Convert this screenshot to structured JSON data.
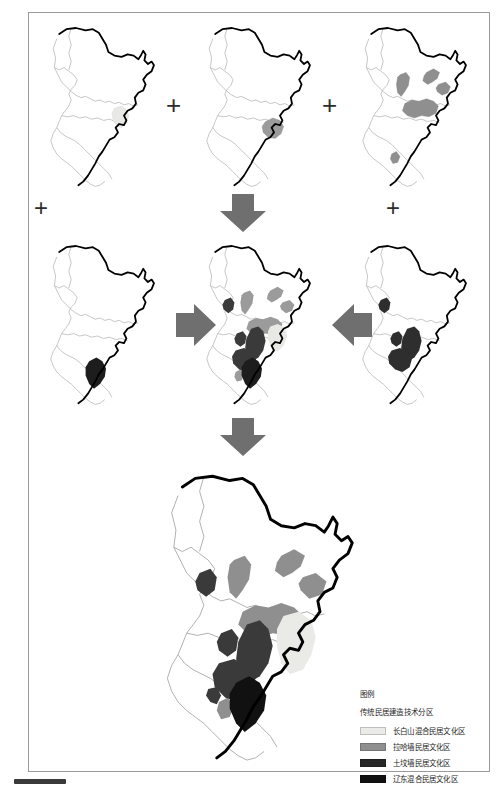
{
  "figure": {
    "type": "map-composite-diagram",
    "subject": "传统民居建造技术分区",
    "region": "Northeast China (Heilongjiang / Jilin / Liaoning)",
    "panel_count": 7,
    "connector_plus": "+",
    "panels": [
      {
        "id": "p1",
        "row": 1,
        "col": 1,
        "name": "changbai-mixed-layer",
        "highlight_color": "#e8e8e4",
        "layer_label": "长白山混合民居文化区"
      },
      {
        "id": "p2",
        "row": 1,
        "col": 2,
        "name": "laha-wall-layer",
        "highlight_color": "#9b9b9b",
        "layer_label": "拉哈墙民居文化区"
      },
      {
        "id": "p3",
        "row": 1,
        "col": 3,
        "name": "scattered-gray-layer",
        "highlight_color": "#8f8f8f",
        "layer_label": "拉哈墙民居文化区"
      },
      {
        "id": "p4",
        "row": 2,
        "col": 1,
        "name": "liaodong-mixed-layer",
        "highlight_color": "#1d1d1d",
        "layer_label": "辽东混合民居文化区"
      },
      {
        "id": "p5",
        "row": 2,
        "col": 2,
        "name": "combined-overlay-map",
        "highlight_color": "#555555",
        "layer_label": "叠加结果"
      },
      {
        "id": "p6",
        "row": 2,
        "col": 3,
        "name": "earth-wall-layer",
        "highlight_color": "#2e2e2e",
        "layer_label": "土坟墙民居文化区"
      },
      {
        "id": "p7",
        "row": 3,
        "col": 2,
        "name": "final-synthesis-map",
        "highlight_color": "#3a3a3a",
        "layer_label": "最终分区图"
      }
    ],
    "arrows": [
      {
        "name": "arrow-down-top",
        "direction": "down"
      },
      {
        "name": "arrow-right-mid",
        "direction": "right"
      },
      {
        "name": "arrow-left-mid",
        "direction": "left"
      },
      {
        "name": "arrow-down-bottom",
        "direction": "down"
      }
    ],
    "colors": {
      "boundary_national": "#000000",
      "boundary_province": "#a9a9a9",
      "arrow_fill": "#6f6f6f",
      "page_border": "#9a9a9a"
    }
  },
  "legend": {
    "title": "图例",
    "subtitle": "传统民居建造技术分区",
    "items": [
      {
        "label": "长白山混合民居文化区",
        "color": "#eaeae6"
      },
      {
        "label": "拉哈墙民居文化区",
        "color": "#8f8f8f"
      },
      {
        "label": "土坟墙民居文化区",
        "color": "#262626"
      },
      {
        "label": "辽东混合民居文化区",
        "color": "#111111"
      }
    ]
  }
}
